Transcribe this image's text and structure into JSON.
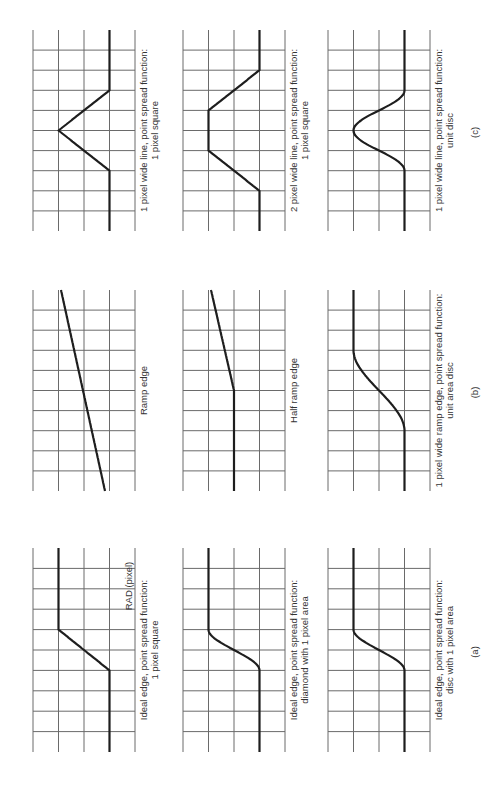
{
  "figure": {
    "orientation": "rotated 90 degrees counter-clockwise",
    "subfigures": [
      {
        "id": "a",
        "label": "(a)",
        "panels": [
          {
            "caption_line1": "Ideal edge, point spread function:",
            "caption_line2": "1 pixel square",
            "annotation": "RAD (pixel)",
            "profile": "linear-edge-1px"
          },
          {
            "caption_line1": "Ideal edge, point spread function:",
            "caption_line2": "diamond with 1 pixel area",
            "annotation": "",
            "profile": "smooth-edge-diamond"
          },
          {
            "caption_line1": "Ideal edge, point spread function:",
            "caption_line2": "disc with 1 pixel area",
            "annotation": "",
            "profile": "smooth-edge-disc"
          }
        ]
      },
      {
        "id": "b",
        "label": "(b)",
        "panels": [
          {
            "caption_line1": "Ramp edge",
            "caption_line2": "",
            "profile": "ramp"
          },
          {
            "caption_line1": "Half ramp edge",
            "caption_line2": "",
            "profile": "half-ramp"
          },
          {
            "caption_line1": "1 pixel wide ramp edge, point spread function:",
            "caption_line2": "unit area disc",
            "profile": "smooth-ramp-disc"
          }
        ]
      },
      {
        "id": "c",
        "label": "(c)",
        "panels": [
          {
            "caption_line1": "1 pixel wide line, point spread function:",
            "caption_line2": "1 pixel square",
            "profile": "triangle"
          },
          {
            "caption_line1": "2 pixel wide line, point spread function:",
            "caption_line2": "1 pixel square",
            "profile": "trapezoid"
          },
          {
            "caption_line1": "1 pixel wide line, point spread function:",
            "caption_line2": "unit disc",
            "profile": "gaussian-bump"
          }
        ]
      }
    ]
  }
}
